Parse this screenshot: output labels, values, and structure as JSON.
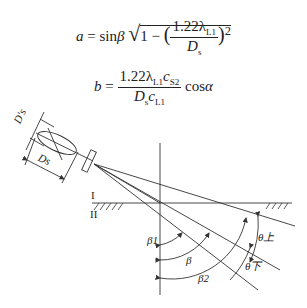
{
  "equations": {
    "a": {
      "lhs": "a",
      "eq": "=",
      "sin": "sin",
      "beta": "β",
      "sqrt_one": "1 −",
      "num": "1.22λ",
      "num_sub": "L1",
      "den": "D",
      "den_sub": "s",
      "power": "2"
    },
    "b": {
      "lhs": "b",
      "eq": "=",
      "num": "1.22λ",
      "num_sub1": "L1",
      "num_c": "c",
      "num_sub2": "S2",
      "den": "D",
      "den_sub": "s",
      "den_c": "c",
      "den_sub2": "L1",
      "cos": "cos",
      "alpha": "α"
    }
  },
  "diagram": {
    "labels": {
      "ds_prime": "D′s",
      "ds": "Ds",
      "medium1": "I",
      "medium2": "II",
      "beta1": "β1",
      "beta": "β",
      "beta2": "β2",
      "theta_upper": "θ上",
      "theta_lower": "θ下"
    },
    "line_color": "#333333"
  }
}
